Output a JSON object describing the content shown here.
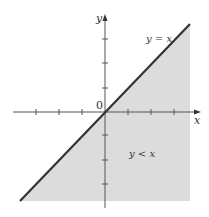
{
  "diagram": {
    "region_label": "y < x",
    "line_label": "y = x",
    "origin_label": "0",
    "x_axis_label": "x",
    "y_axis_label": "y",
    "colors": {
      "region_fill": "#dcdcdc",
      "line": "#333333",
      "axis": "#555555"
    }
  }
}
